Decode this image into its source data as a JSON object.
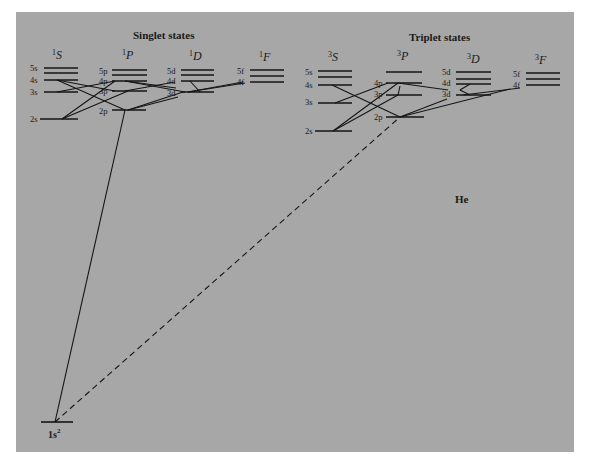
{
  "figure": {
    "element": "He",
    "colors": {
      "panel": "#a7a7a7",
      "ink": "#151515",
      "page": "#ffffff"
    }
  },
  "singlet": {
    "heading": "Singlet states",
    "terms": [
      {
        "mult": "1",
        "L": "S"
      },
      {
        "mult": "1",
        "L": "P"
      },
      {
        "mult": "1",
        "L": "D"
      },
      {
        "mult": "1",
        "L": "F"
      }
    ],
    "levels": {
      "S": [
        "5s",
        "4s",
        "3s",
        "2s"
      ],
      "P": [
        "5p",
        "4p",
        "3p",
        "2p"
      ],
      "D": [
        "5d",
        "4d",
        "3d"
      ],
      "F": [
        "5f",
        "4f"
      ]
    }
  },
  "triplet": {
    "heading": "Triplet states",
    "terms": [
      {
        "mult": "3",
        "L": "S"
      },
      {
        "mult": "3",
        "L": "P"
      },
      {
        "mult": "3",
        "L": "D"
      },
      {
        "mult": "3",
        "L": "F"
      }
    ],
    "levels": {
      "S": [
        "5s",
        "4s",
        "3s",
        "2s"
      ],
      "P": [
        "4p",
        "3p",
        "2p"
      ],
      "D": [
        "5d",
        "4d",
        "3d"
      ],
      "F": [
        "5f",
        "4f"
      ]
    }
  },
  "ground": {
    "label": "1s",
    "sup": "2"
  },
  "transitions": [
    {
      "from": "1s2",
      "to": "2p (singlet)",
      "style": "solid"
    },
    {
      "from": "1s2",
      "to": "2p (triplet)",
      "style": "dashed"
    }
  ]
}
